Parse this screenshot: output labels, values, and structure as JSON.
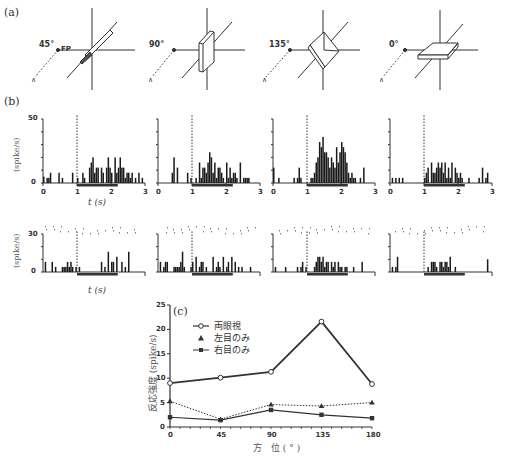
{
  "labels": {
    "panel_a": "(a)",
    "panel_b": "(b)",
    "panel_c": "(c)"
  },
  "panel_a": {
    "diagrams": [
      {
        "angle_label": "45°",
        "fp_label": "FP",
        "orientation_deg": 45
      },
      {
        "angle_label": "90°",
        "orientation_deg": 90
      },
      {
        "angle_label": "135°",
        "orientation_deg": 135
      },
      {
        "angle_label": "0°",
        "orientation_deg": 0
      }
    ]
  },
  "panel_b": {
    "y_label": "(spike/s)",
    "x_label": "t (s)",
    "top_row": {
      "y_max_label": "50",
      "y_min_label": "0",
      "x_ticks": [
        "0",
        "1",
        "2",
        "3"
      ]
    },
    "bottom_row": {
      "y_max_label": "30",
      "y_min_label": "0"
    }
  },
  "chart_data": [
    {
      "type": "bar",
      "title": "(b) PSTH binocular, 45°",
      "xlabel": "t (s)",
      "ylabel": "(spike/s)",
      "xlim": [
        0,
        3
      ],
      "ylim": [
        0,
        50
      ],
      "stimulus_onset": 1.0,
      "stimulus_bar": [
        1.0,
        2.2
      ],
      "bins_start": 0,
      "bin_width": 0.05,
      "values": [
        5,
        0,
        4,
        4,
        8,
        0,
        0,
        0,
        0,
        8,
        0,
        4,
        0,
        0,
        0,
        0,
        0,
        8,
        0,
        0,
        4,
        0,
        0,
        8,
        4,
        0,
        0,
        12,
        16,
        20,
        8,
        12,
        12,
        0,
        12,
        8,
        0,
        12,
        20,
        12,
        8,
        0,
        20,
        8,
        12,
        20,
        12,
        12,
        4,
        8,
        8,
        4,
        8,
        0,
        4,
        0,
        8,
        0,
        4,
        0
      ]
    },
    {
      "type": "bar",
      "title": "(b) PSTH binocular, 90°",
      "xlabel": "t (s)",
      "ylabel": "(spike/s)",
      "xlim": [
        0,
        3
      ],
      "ylim": [
        0,
        50
      ],
      "stimulus_onset": 1.0,
      "stimulus_bar": [
        1.0,
        2.2
      ],
      "bins_start": 0,
      "bin_width": 0.05,
      "values": [
        0,
        0,
        0,
        0,
        0,
        0,
        0,
        0,
        8,
        20,
        0,
        12,
        0,
        0,
        0,
        0,
        0,
        8,
        0,
        4,
        0,
        0,
        4,
        0,
        16,
        4,
        12,
        12,
        8,
        16,
        24,
        20,
        8,
        16,
        4,
        12,
        12,
        8,
        4,
        0,
        16,
        4,
        12,
        4,
        8,
        8,
        4,
        0,
        16,
        0,
        4,
        4,
        4,
        4,
        0,
        0,
        0,
        0,
        0,
        0
      ]
    },
    {
      "type": "bar",
      "title": "(b) PSTH binocular, 135°",
      "xlabel": "t (s)",
      "ylabel": "(spike/s)",
      "xlim": [
        0,
        3
      ],
      "ylim": [
        0,
        50
      ],
      "stimulus_onset": 1.0,
      "stimulus_bar": [
        1.0,
        2.2
      ],
      "bins_start": 0,
      "bin_width": 0.05,
      "values": [
        12,
        0,
        0,
        4,
        0,
        0,
        0,
        0,
        0,
        0,
        0,
        0,
        4,
        0,
        4,
        12,
        4,
        0,
        0,
        0,
        0,
        0,
        4,
        4,
        8,
        16,
        20,
        32,
        28,
        36,
        24,
        24,
        20,
        12,
        20,
        16,
        12,
        28,
        16,
        24,
        32,
        28,
        24,
        16,
        8,
        4,
        8,
        4,
        4,
        0,
        0,
        4,
        0,
        12,
        0,
        0,
        0,
        0,
        0,
        0
      ]
    },
    {
      "type": "bar",
      "title": "(b) PSTH binocular, 0°",
      "xlabel": "t (s)",
      "ylabel": "(spike/s)",
      "xlim": [
        0,
        3
      ],
      "ylim": [
        0,
        50
      ],
      "stimulus_onset": 1.0,
      "stimulus_bar": [
        1.0,
        2.2
      ],
      "bins_start": 0,
      "bin_width": 0.05,
      "values": [
        0,
        4,
        0,
        4,
        0,
        4,
        0,
        4,
        0,
        0,
        0,
        0,
        0,
        0,
        0,
        0,
        0,
        0,
        0,
        0,
        4,
        8,
        12,
        0,
        16,
        8,
        8,
        12,
        16,
        12,
        16,
        8,
        16,
        4,
        12,
        4,
        16,
        0,
        12,
        8,
        4,
        8,
        4,
        0,
        0,
        0,
        4,
        0,
        0,
        0,
        0,
        0,
        4,
        0,
        12,
        0,
        4,
        8,
        0,
        0
      ]
    },
    {
      "type": "bar",
      "title": "(b) PSTH monocular, 45°",
      "xlabel": "t (s)",
      "ylabel": "(spike/s)",
      "xlim": [
        0,
        3
      ],
      "ylim": [
        0,
        30
      ],
      "stimulus_onset": 1.0,
      "stimulus_bar": [
        1.0,
        2.2
      ],
      "bins_start": 0,
      "bin_width": 0.05,
      "values": [
        0,
        8,
        0,
        0,
        0,
        8,
        0,
        4,
        0,
        0,
        0,
        4,
        4,
        4,
        8,
        4,
        8,
        4,
        0,
        4,
        0,
        4,
        0,
        0,
        0,
        0,
        0,
        0,
        0,
        0,
        0,
        0,
        0,
        0,
        8,
        0,
        4,
        0,
        16,
        0,
        8,
        8,
        0,
        12,
        0,
        0,
        8,
        0,
        4,
        0,
        16,
        0,
        0,
        0,
        0,
        0,
        0,
        0,
        0,
        0
      ]
    },
    {
      "type": "bar",
      "title": "(b) PSTH monocular, 90°",
      "xlabel": "t (s)",
      "ylabel": "(spike/s)",
      "xlim": [
        0,
        3
      ],
      "ylim": [
        0,
        30
      ],
      "stimulus_onset": 1.0,
      "stimulus_bar": [
        1.0,
        2.2
      ],
      "bins_start": 0,
      "bin_width": 0.05,
      "values": [
        0,
        8,
        0,
        4,
        8,
        8,
        0,
        0,
        0,
        4,
        4,
        4,
        4,
        8,
        16,
        4,
        0,
        0,
        0,
        4,
        8,
        0,
        12,
        0,
        4,
        8,
        8,
        0,
        4,
        0,
        0,
        0,
        12,
        0,
        4,
        8,
        4,
        0,
        12,
        0,
        4,
        8,
        0,
        12,
        0,
        8,
        0,
        4,
        0,
        4,
        0,
        0,
        0,
        0,
        4,
        0,
        0,
        0,
        0,
        0
      ]
    },
    {
      "type": "bar",
      "title": "(b) PSTH monocular, 135°",
      "xlabel": "t (s)",
      "ylabel": "(spike/s)",
      "xlim": [
        0,
        3
      ],
      "ylim": [
        0,
        30
      ],
      "stimulus_onset": 1.0,
      "stimulus_bar": [
        1.0,
        2.2
      ],
      "bins_start": 0,
      "bin_width": 0.05,
      "values": [
        0,
        4,
        0,
        0,
        0,
        0,
        0,
        4,
        0,
        0,
        0,
        0,
        0,
        0,
        4,
        0,
        4,
        8,
        0,
        4,
        0,
        0,
        0,
        0,
        4,
        8,
        12,
        12,
        8,
        12,
        4,
        8,
        8,
        0,
        8,
        4,
        8,
        0,
        8,
        4,
        4,
        0,
        4,
        4,
        0,
        0,
        0,
        4,
        0,
        0,
        0,
        0,
        8,
        0,
        0,
        0,
        0,
        0,
        0,
        0
      ]
    },
    {
      "type": "bar",
      "title": "(b) PSTH monocular, 0°",
      "xlabel": "t (s)",
      "ylabel": "(spike/s)",
      "xlim": [
        0,
        3
      ],
      "ylim": [
        0,
        30
      ],
      "stimulus_onset": 1.0,
      "stimulus_bar": [
        1.0,
        2.2
      ],
      "bins_start": 0,
      "bin_width": 0.05,
      "values": [
        0,
        4,
        0,
        4,
        12,
        0,
        0,
        0,
        0,
        0,
        0,
        0,
        0,
        0,
        0,
        0,
        0,
        0,
        0,
        0,
        0,
        0,
        4,
        0,
        8,
        8,
        8,
        4,
        0,
        8,
        8,
        4,
        8,
        8,
        4,
        12,
        0,
        0,
        4,
        0,
        0,
        0,
        0,
        0,
        0,
        0,
        0,
        0,
        0,
        0,
        0,
        0,
        0,
        0,
        0,
        0,
        0,
        10,
        0,
        0
      ]
    },
    {
      "type": "line",
      "title": "(c)",
      "xlabel": "方 位(°)",
      "ylabel": "反応強度 (spike/s)",
      "x": [
        0,
        45,
        90,
        135,
        180
      ],
      "xlim": [
        0,
        180
      ],
      "ylim": [
        0,
        25
      ],
      "x_ticks": [
        "0",
        "45",
        "90",
        "135",
        "180"
      ],
      "y_ticks": [
        "0",
        "5",
        "10",
        "15",
        "20",
        "25"
      ],
      "grid": false,
      "legend_position": "upper-left",
      "series": [
        {
          "name": "両眼視",
          "marker": "open-circle",
          "line": "solid-thick",
          "values": [
            9.0,
            10.1,
            11.3,
            21.6,
            8.8
          ]
        },
        {
          "name": "左目のみ",
          "marker": "triangle",
          "line": "dotted",
          "values": [
            5.3,
            1.6,
            4.6,
            4.3,
            5.0
          ]
        },
        {
          "name": "右目のみ",
          "marker": "filled-square",
          "line": "solid",
          "values": [
            2.0,
            1.4,
            3.5,
            2.5,
            1.8
          ]
        }
      ]
    }
  ]
}
